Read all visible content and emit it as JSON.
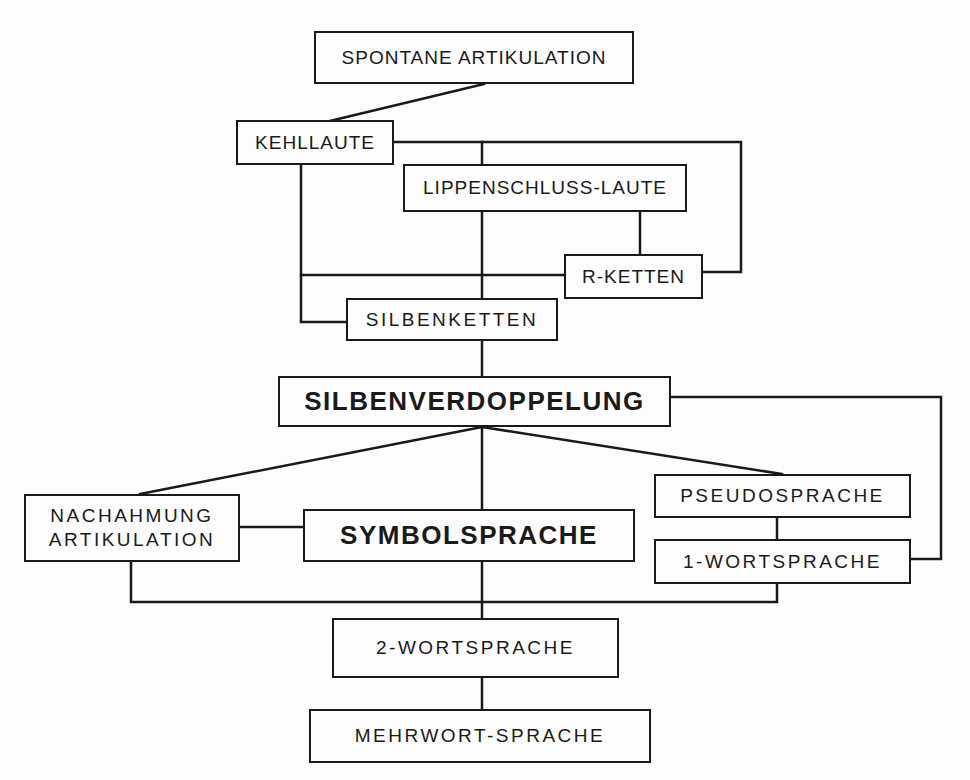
{
  "diagram": {
    "type": "flowchart",
    "nodes": {
      "spontane": {
        "label": "SPONTANE ARTIKULATION"
      },
      "kehllaute": {
        "label": "KEHLLAUTE"
      },
      "lippen": {
        "label": "LIPPENSCHLUSS-LAUTE"
      },
      "rketten": {
        "label": "R-KETTEN"
      },
      "silbenketten": {
        "label": "SILBENKETTEN"
      },
      "silbenverdoppelung": {
        "label": "SILBENVERDOPPELUNG"
      },
      "nachahmung": {
        "label": "NACHAHMUNG\nARTIKULATION"
      },
      "symbolsprache": {
        "label": "SYMBOLSPRACHE"
      },
      "pseudosprache": {
        "label": "PSEUDOSPRACHE"
      },
      "wort1": {
        "label": "1-WORTSPRACHE"
      },
      "wort2": {
        "label": "2-WORTSPRACHE"
      },
      "mehrwort": {
        "label": "MEHRWORT-SPRACHE"
      }
    },
    "edges": [
      [
        "SPONTANE ARTIKULATION",
        "KEHLLAUTE"
      ],
      [
        "KEHLLAUTE",
        "LIPPENSCHLUSS-LAUTE"
      ],
      [
        "KEHLLAUTE",
        "R-KETTEN"
      ],
      [
        "KEHLLAUTE",
        "SILBENKETTEN"
      ],
      [
        "LIPPENSCHLUSS-LAUTE",
        "R-KETTEN"
      ],
      [
        "LIPPENSCHLUSS-LAUTE",
        "SILBENKETTEN"
      ],
      [
        "R-KETTEN",
        "SILBENKETTEN"
      ],
      [
        "SILBENKETTEN",
        "SILBENVERDOPPELUNG"
      ],
      [
        "SILBENVERDOPPELUNG",
        "NACHAHMUNG ARTIKULATION"
      ],
      [
        "SILBENVERDOPPELUNG",
        "SYMBOLSPRACHE"
      ],
      [
        "SILBENVERDOPPELUNG",
        "PSEUDOSPRACHE"
      ],
      [
        "SILBENVERDOPPELUNG",
        "1-WORTSPRACHE"
      ],
      [
        "NACHAHMUNG ARTIKULATION",
        "SYMBOLSPRACHE"
      ],
      [
        "PSEUDOSPRACHE",
        "1-WORTSPRACHE"
      ],
      [
        "NACHAHMUNG ARTIKULATION",
        "2-WORTSPRACHE"
      ],
      [
        "SYMBOLSPRACHE",
        "2-WORTSPRACHE"
      ],
      [
        "1-WORTSPRACHE",
        "2-WORTSPRACHE"
      ],
      [
        "2-WORTSPRACHE",
        "MEHRWORT-SPRACHE"
      ]
    ]
  }
}
